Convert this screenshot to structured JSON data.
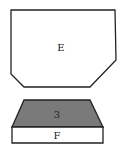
{
  "diagram": {
    "shapes": [
      {
        "id": "E",
        "label": "E",
        "kind": "chamfered-polygon",
        "fill": "#ffffff",
        "stroke": "#222222",
        "points": "11,10 115,10 116,60 90,87 24,87 11,74"
      },
      {
        "id": "3",
        "label": "3",
        "kind": "trapezoid",
        "fill": "#7a7a7a",
        "stroke": "#222222",
        "points": "24,100 90,100 103,127 12,127"
      },
      {
        "id": "F",
        "label": "F",
        "kind": "rectangle",
        "fill": "#ffffff",
        "stroke": "#222222",
        "points": "12,127 103,127 103,143 12,143"
      }
    ],
    "labels": {
      "E": {
        "text": "E",
        "x": 61,
        "y": 51
      },
      "3": {
        "text": "3",
        "x": 57,
        "y": 118
      },
      "F": {
        "text": "F",
        "x": 57,
        "y": 139
      }
    }
  }
}
